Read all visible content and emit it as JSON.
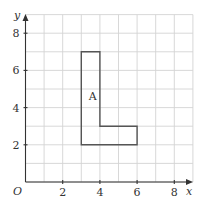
{
  "diagram": {
    "type": "coordinate-grid",
    "x_axis": {
      "label": "x",
      "min": 0,
      "max": 9,
      "tick_labels": [
        "2",
        "4",
        "6",
        "8"
      ],
      "tick_values": [
        2,
        4,
        6,
        8
      ]
    },
    "y_axis": {
      "label": "y",
      "min": 0,
      "max": 9,
      "tick_labels": [
        "2",
        "4",
        "6",
        "8"
      ],
      "tick_values": [
        2,
        4,
        6,
        8
      ]
    },
    "origin_label": "O",
    "grid": {
      "on": true,
      "step": 1
    },
    "shapes": [
      {
        "label": "A",
        "vertices": [
          [
            3,
            2
          ],
          [
            6,
            2
          ],
          [
            6,
            3
          ],
          [
            4,
            3
          ],
          [
            4,
            7
          ],
          [
            3,
            7
          ]
        ],
        "label_position": [
          3.4,
          4.4
        ]
      }
    ],
    "colors": {
      "grid": "#d4d4d4",
      "axis": "#333333",
      "shape": "#555555"
    }
  }
}
